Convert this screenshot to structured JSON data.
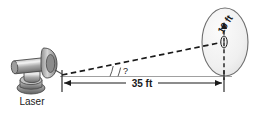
{
  "figure": {
    "type": "geometry-diagram",
    "background_color": "#ffffff"
  },
  "labels": {
    "laser": "Laser",
    "distance": "35 ft",
    "target_diameter": "10 ft",
    "angle": "?"
  },
  "colors": {
    "outline": "#3a3a3a",
    "ground_line": "#9a9a9a",
    "beam_dash": "#1a1a1a",
    "target_fill": "#f2f2f2",
    "target_stroke": "#6e6e6e",
    "device_light": "#d8d8d8",
    "device_mid": "#a8a8a8",
    "device_dark": "#6b6b6b",
    "text": "#1a1a1a"
  },
  "geometry": {
    "laser_origin": {
      "x": 62,
      "y": 75
    },
    "target_center": {
      "x": 222,
      "y": 42
    },
    "target_ellipse": {
      "cx": 225,
      "cy": 42,
      "rx": 23,
      "ry": 34
    },
    "dimension_line_y": 82,
    "dimension_from_x": 62,
    "dimension_to_x": 222,
    "angle_arc_label_x": 122,
    "angle_arc_label_y": 72,
    "distance_label_x": 140,
    "distance_label_y": 85,
    "target_label_rotation_deg": -58
  }
}
